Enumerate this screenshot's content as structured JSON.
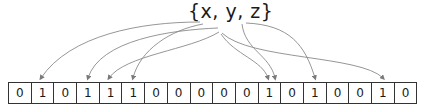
{
  "set_label": "{x, y, z}",
  "bits": [
    "0",
    "1",
    "0",
    "1",
    "1",
    "1",
    "0",
    "0",
    "0",
    "0",
    "0",
    "1",
    "0",
    "1",
    "0",
    "0",
    "1",
    "0"
  ],
  "colors": {
    "arrow": "#7a7a7a",
    "cell_border": "#333333",
    "text": "#1a1a1a"
  },
  "hashes": {
    "x": [
      1,
      4,
      11
    ],
    "y": [
      3,
      5,
      11,
      16
    ],
    "z": [
      11,
      13
    ]
  }
}
